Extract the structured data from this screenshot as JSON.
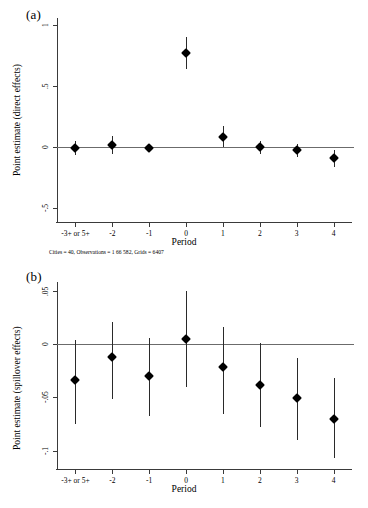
{
  "figure": {
    "width": 368,
    "height": 508,
    "background": "#ffffff",
    "marker_color": "#000000",
    "axis_color": "#3a3a3a",
    "zeroline_color": "#6b6b6b"
  },
  "panels": [
    {
      "tag": "(a)",
      "footnote": "Cities = 40, Observations = 1 66 582, Grids = 6407"
    },
    {
      "tag": "(b)",
      "footnote": ""
    }
  ],
  "chart_data": [
    {
      "type": "scatter",
      "title": "",
      "panel": "(a)",
      "xlabel": "Period",
      "ylabel": "Point estimate (direct effects)",
      "categories": [
        "-3+ or 5+",
        "-2",
        "-1",
        "0",
        "1",
        "2",
        "3",
        "4"
      ],
      "x": [
        0,
        1,
        2,
        3,
        4,
        5,
        6,
        7
      ],
      "values": [
        -0.005,
        0.02,
        -0.002,
        0.775,
        0.085,
        0.0,
        -0.025,
        -0.09
      ],
      "ci_lower": [
        -0.065,
        -0.055,
        -0.012,
        0.645,
        0.0,
        -0.055,
        -0.08,
        -0.165
      ],
      "ci_upper": [
        0.055,
        0.095,
        0.008,
        0.905,
        0.175,
        0.055,
        0.03,
        -0.02
      ],
      "yticks": [
        1,
        0.5,
        0,
        -0.5
      ],
      "ytick_labels": [
        "1",
        ".5",
        "0",
        "-.5"
      ],
      "ylim": [
        -0.62,
        1.06
      ],
      "grid": false,
      "legend": "none",
      "zero_reference_line": 0
    },
    {
      "type": "scatter",
      "title": "",
      "panel": "(b)",
      "xlabel": "Period",
      "ylabel": "Point estimate (spillover effects)",
      "categories": [
        "-3+ or 5+",
        "-2",
        "-1",
        "0",
        "1",
        "2",
        "3",
        "4"
      ],
      "x": [
        0,
        1,
        2,
        3,
        4,
        5,
        6,
        7
      ],
      "values": [
        -0.034,
        -0.012,
        -0.03,
        0.005,
        -0.022,
        -0.038,
        -0.051,
        -0.07
      ],
      "ci_lower": [
        -0.075,
        -0.052,
        -0.067,
        -0.04,
        -0.066,
        -0.078,
        -0.09,
        -0.107
      ],
      "ci_upper": [
        0.004,
        0.021,
        0.006,
        0.05,
        0.016,
        0.001,
        -0.013,
        -0.032
      ],
      "yticks": [
        0.05,
        0,
        -0.05,
        -0.1
      ],
      "ytick_labels": [
        ".05",
        "0",
        "-.05",
        "-.1"
      ],
      "ylim": [
        -0.118,
        0.058
      ],
      "grid": false,
      "legend": "none",
      "zero_reference_line": 0
    }
  ]
}
